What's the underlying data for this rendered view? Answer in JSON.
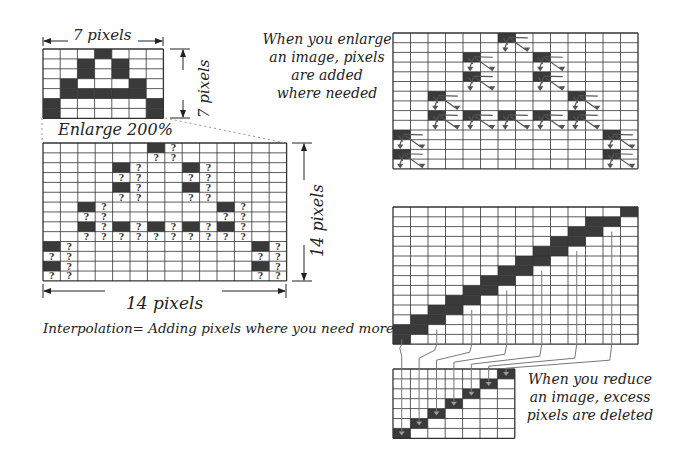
{
  "colors": {
    "dark_pixel": "#3a3a3a",
    "grid_line": "#333333",
    "connector": "#777777",
    "marker": "#555555",
    "dotted": "#999999"
  },
  "labels": {
    "small_width": "7 pixels",
    "small_height": "7 pixels",
    "enlarge": "Enlarge 200%",
    "large_height": "14 pixels",
    "large_width": "14 pixels",
    "interpolation": "Interpolation= Adding pixels where you need more",
    "question_mark": "?"
  },
  "captions": {
    "enlarge": [
      "When you enlarge",
      "an image, pixels",
      "are added",
      "where needed"
    ],
    "reduce": [
      "When you reduce",
      "an image, excess",
      "pixels are deleted"
    ]
  },
  "grids": {
    "original": {
      "x": 43,
      "y": 49,
      "cols": 7,
      "rows": 7,
      "cell_w": 17.2,
      "cell_h": 9.9,
      "dark": [
        [
          0,
          3
        ],
        [
          1,
          2
        ],
        [
          1,
          4
        ],
        [
          2,
          2
        ],
        [
          2,
          4
        ],
        [
          3,
          1
        ],
        [
          3,
          5
        ],
        [
          4,
          1
        ],
        [
          4,
          2
        ],
        [
          4,
          3
        ],
        [
          4,
          4
        ],
        [
          4,
          5
        ],
        [
          5,
          0
        ],
        [
          5,
          6
        ],
        [
          6,
          0
        ],
        [
          6,
          6
        ]
      ]
    },
    "enlarged_question": {
      "x": 43,
      "y": 143,
      "cols": 14,
      "rows": 14,
      "cell_w": 17.4,
      "cell_h": 9.85,
      "source_dark": [
        [
          0,
          3
        ],
        [
          1,
          2
        ],
        [
          1,
          4
        ],
        [
          2,
          2
        ],
        [
          2,
          4
        ],
        [
          3,
          1
        ],
        [
          3,
          5
        ],
        [
          4,
          1
        ],
        [
          4,
          2
        ],
        [
          4,
          3
        ],
        [
          4,
          4
        ],
        [
          4,
          5
        ],
        [
          5,
          0
        ],
        [
          5,
          6
        ],
        [
          6,
          0
        ],
        [
          6,
          6
        ]
      ],
      "scale": 2
    },
    "enlarged_arrows": {
      "x": 393,
      "y": 33,
      "cols": 14,
      "rows": 14,
      "cell_w": 17.5,
      "cell_h": 9.7,
      "source_dark": [
        [
          0,
          3
        ],
        [
          1,
          2
        ],
        [
          1,
          4
        ],
        [
          2,
          2
        ],
        [
          2,
          4
        ],
        [
          3,
          1
        ],
        [
          3,
          5
        ],
        [
          4,
          1
        ],
        [
          4,
          2
        ],
        [
          4,
          3
        ],
        [
          4,
          4
        ],
        [
          4,
          5
        ],
        [
          5,
          0
        ],
        [
          5,
          6
        ],
        [
          6,
          0
        ],
        [
          6,
          6
        ]
      ],
      "scale": 2
    },
    "diagonal_large": {
      "x": 393,
      "y": 207,
      "cols": 14,
      "rows": 14,
      "cell_w": 17.5,
      "cell_h": 9.8,
      "dark": [
        [
          0,
          13
        ],
        [
          1,
          11
        ],
        [
          1,
          12
        ],
        [
          2,
          10
        ],
        [
          2,
          11
        ],
        [
          3,
          9
        ],
        [
          3,
          10
        ],
        [
          4,
          8
        ],
        [
          4,
          9
        ],
        [
          5,
          7
        ],
        [
          5,
          8
        ],
        [
          6,
          6
        ],
        [
          6,
          7
        ],
        [
          7,
          5
        ],
        [
          7,
          6
        ],
        [
          8,
          4
        ],
        [
          8,
          5
        ],
        [
          9,
          3
        ],
        [
          9,
          4
        ],
        [
          10,
          2
        ],
        [
          10,
          3
        ],
        [
          11,
          1
        ],
        [
          11,
          2
        ],
        [
          12,
          0
        ],
        [
          12,
          1
        ],
        [
          13,
          0
        ]
      ]
    },
    "diagonal_small": {
      "x": 393,
      "y": 369,
      "cols": 7,
      "rows": 7,
      "cell_w": 17.4,
      "cell_h": 9.9,
      "dark": [
        [
          0,
          6
        ],
        [
          1,
          5
        ],
        [
          2,
          4
        ],
        [
          3,
          3
        ],
        [
          4,
          2
        ],
        [
          5,
          1
        ],
        [
          6,
          0
        ]
      ]
    }
  },
  "connectors": [
    {
      "from": [
        13,
        0
      ],
      "to": [
        6,
        0
      ]
    },
    {
      "from": [
        12,
        2
      ],
      "to": [
        5,
        1
      ]
    },
    {
      "from": [
        10,
        4
      ],
      "to": [
        4,
        2
      ]
    },
    {
      "from": [
        8,
        6
      ],
      "to": [
        3,
        3
      ]
    },
    {
      "from": [
        6,
        8
      ],
      "to": [
        2,
        4
      ]
    },
    {
      "from": [
        4,
        10
      ],
      "to": [
        1,
        5
      ]
    },
    {
      "from": [
        2,
        12
      ],
      "to": [
        0,
        6
      ]
    }
  ]
}
